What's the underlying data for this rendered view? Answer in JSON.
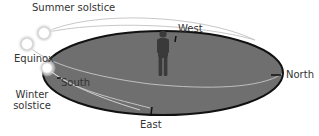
{
  "diagram": {
    "labels": {
      "summer_solstice": "Summer solstice",
      "equinox": "Equinox",
      "winter_solstice_line1": "Winter",
      "winter_solstice_line2": "solstice",
      "west": "West",
      "south": "South",
      "north": "North",
      "east": "East"
    },
    "colors": {
      "ground": "#6e6e6e",
      "ground_edge": "#111111",
      "arc": "#bdbdbd",
      "sun_glow": "#e0e0e0",
      "person": "#3a3a3a",
      "text": "#333333"
    }
  }
}
